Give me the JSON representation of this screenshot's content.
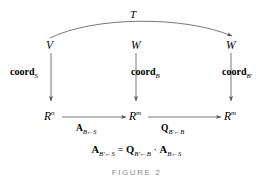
{
  "figure": {
    "caption": "FIGURE 2",
    "top_map_label": "T",
    "top_row": [
      {
        "name": "V",
        "sup": ""
      },
      {
        "name": "W",
        "sup": ""
      },
      {
        "name": "W",
        "sup": ""
      }
    ],
    "bottom_row": [
      {
        "name": "R",
        "sup": "n"
      },
      {
        "name": "R",
        "sup": "m"
      },
      {
        "name": "R",
        "sup": "m"
      }
    ],
    "vertical_maps": [
      {
        "base": "coord",
        "sub": "S"
      },
      {
        "base": "coord",
        "sub": "B"
      },
      {
        "base": "coord",
        "sub": "B′"
      }
    ],
    "bottom_arrows": [
      {
        "base": "A",
        "sub": "B←S"
      },
      {
        "base": "Q",
        "sub": "B′←B"
      }
    ],
    "equation": {
      "lhs_base": "A",
      "lhs_sub": "B′←S",
      "equals": "=",
      "rhs1_base": "Q",
      "rhs1_sub": "B′←B",
      "operator": "·",
      "rhs2_base": "A",
      "rhs2_sub": "B←S"
    }
  },
  "colors": {
    "ink": "#000000",
    "rule": "#555555",
    "caption": "#8a8a8a",
    "background": "#ffffff"
  }
}
